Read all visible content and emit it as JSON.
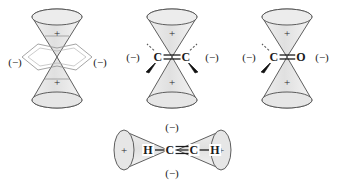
{
  "figure": {
    "background_color": "#ffffff",
    "lobe_fill": "#e3e3e3",
    "lobe_stroke": "#4d4d4d",
    "bond_color": "#1b1b1b",
    "label_color": "#1b1b1b",
    "plus_sign": "+",
    "minus_sign": "(−)"
  },
  "structures": [
    {
      "id": "structure-1",
      "name": "vertical-double-cone-diamond",
      "formula": "",
      "top_lobe_sign": "+",
      "bottom_lobe_sign": "+",
      "left_label": "(−)",
      "right_label": "(−)",
      "atoms": [],
      "bond_order": 0,
      "has_center_diamond": true
    },
    {
      "id": "structure-2",
      "name": "ethylene-c-c-double-bond",
      "formula": "C=C",
      "top_lobe_sign": "+",
      "bottom_lobe_sign": "+",
      "left_label": "(−)",
      "right_label": "(−)",
      "atoms": [
        "C",
        "C"
      ],
      "bond_order": 2,
      "has_center_diamond": false
    },
    {
      "id": "structure-3",
      "name": "carbonyl-c-o-double-bond",
      "formula": "C=O",
      "top_lobe_sign": "+",
      "bottom_lobe_sign": "+",
      "left_label": "(−)",
      "right_label": "(−)",
      "atoms": [
        "C",
        "O"
      ],
      "bond_order": 2,
      "has_center_diamond": false
    },
    {
      "id": "structure-4",
      "name": "acetylene-h-c-triple-bond-c-h",
      "formula": "H—C≡C—H",
      "left_lobe_sign": "+",
      "right_lobe_sign": "+",
      "top_label": "(−)",
      "bottom_label": "(−)",
      "atoms": [
        "H",
        "C",
        "C",
        "H"
      ],
      "bond_order": 3,
      "has_center_diamond": false
    }
  ],
  "labels": {
    "s1_left": "(−)",
    "s1_right": "(−)",
    "s1_top_plus": "+",
    "s1_bottom_plus": "+",
    "s2_left": "(−)",
    "s2_right": "(−)",
    "s2_top_plus": "+",
    "s2_bottom_plus": "+",
    "s2_atom_left": "C",
    "s2_atom_right": "C",
    "s3_left": "(−)",
    "s3_right": "(−)",
    "s3_top_plus": "+",
    "s3_bottom_plus": "+",
    "s3_atom_left": "C",
    "s3_atom_right": "O",
    "s4_top": "(−)",
    "s4_bottom": "(−)",
    "s4_left_plus": "+",
    "s4_right_plus": "+",
    "s4_h_left": "H",
    "s4_c_left": "C",
    "s4_c_right": "C",
    "s4_h_right": "H"
  }
}
